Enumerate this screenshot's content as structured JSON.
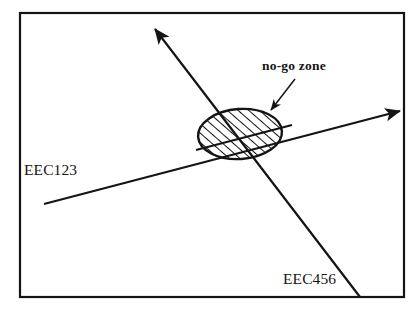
{
  "diagram": {
    "background_color": "#ffffff",
    "stroke_color": "#141414",
    "frame": {
      "name": "diagram-border",
      "x": 20,
      "y": 13,
      "width": 384,
      "height": 284,
      "stroke_width": 2.2
    },
    "labels": {
      "route_one": "EEC123",
      "route_two": "EEC456",
      "zone": "no-go zone"
    },
    "routes": [
      {
        "id": "eec123",
        "label": "EEC123",
        "description": "shallow ascending airway running lower-left to right with arrowhead at right edge",
        "start": {
          "x": 44,
          "y": 204
        },
        "end": {
          "x": 404,
          "y": 110
        },
        "arrow_at": "end",
        "stroke_width": 2.2,
        "label_position": {
          "x": 24,
          "y": 175
        }
      },
      {
        "id": "eec456",
        "label": "EEC456",
        "description": "steep airway running lower-right to upper-left with arrowhead at upper-left",
        "start": {
          "x": 360,
          "y": 297
        },
        "end": {
          "x": 152,
          "y": 25
        },
        "arrow_at": "end",
        "stroke_width": 2.2,
        "label_position": {
          "x": 283,
          "y": 284
        }
      }
    ],
    "zone": {
      "id": "no-go-zone",
      "shape": "ellipse",
      "fill": "hatched",
      "hatch_angle_deg": 45,
      "hatch_spacing_px": 7,
      "center": {
        "x": 240,
        "y": 134
      },
      "radius_x": 42,
      "radius_y": 25,
      "rotation_deg": -4,
      "stroke_width": 2.4
    },
    "annotation": {
      "id": "zone-callout",
      "text": "no-go zone",
      "text_position": {
        "x": 262,
        "y": 70
      },
      "leader_start": {
        "x": 295,
        "y": 79
      },
      "leader_end": {
        "x": 269,
        "y": 112
      },
      "stroke_width": 1.5
    },
    "intersection": {
      "x": 242,
      "y": 152
    }
  }
}
